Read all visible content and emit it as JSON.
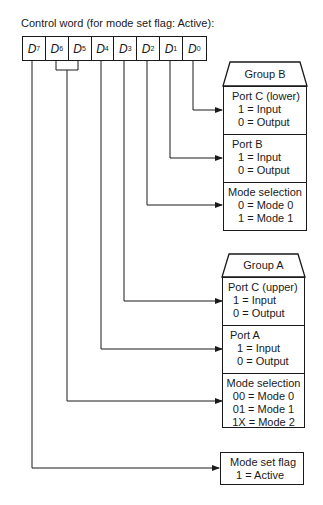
{
  "title": "Control word (for mode set flag: Active):",
  "register": {
    "bits": [
      {
        "name": "D",
        "sub": "7"
      },
      {
        "name": "D",
        "sub": "6"
      },
      {
        "name": "D",
        "sub": "5"
      },
      {
        "name": "D",
        "sub": "4"
      },
      {
        "name": "D",
        "sub": "3"
      },
      {
        "name": "D",
        "sub": "2"
      },
      {
        "name": "D",
        "sub": "1"
      },
      {
        "name": "D",
        "sub": "0"
      }
    ]
  },
  "group_b": {
    "label": "Group B",
    "port_c_lower": {
      "title": "Port C (lower)",
      "lines": [
        "1 = Input",
        "0 = Output"
      ]
    },
    "port_b": {
      "title": "Port B",
      "lines": [
        "1 = Input",
        "0 = Output"
      ]
    },
    "mode_selection": {
      "title": "Mode selection",
      "lines": [
        "0 = Mode 0",
        "1 = Mode 1"
      ]
    }
  },
  "group_a": {
    "label": "Group A",
    "port_c_upper": {
      "title": "Port C (upper)",
      "lines": [
        "1 = Input",
        "0 = Output"
      ]
    },
    "port_a": {
      "title": "Port A",
      "lines": [
        "1 = Input",
        "0 = Output"
      ]
    },
    "mode_selection": {
      "title": "Mode selection",
      "lines": [
        "00 = Mode 0",
        "01 = Mode 1",
        "1X = Mode 2"
      ]
    }
  },
  "mode_set_flag": {
    "title": "Mode set flag",
    "lines": [
      "1 = Active"
    ]
  },
  "colors": {
    "line": "#1a1a1a",
    "background": "#ffffff"
  }
}
